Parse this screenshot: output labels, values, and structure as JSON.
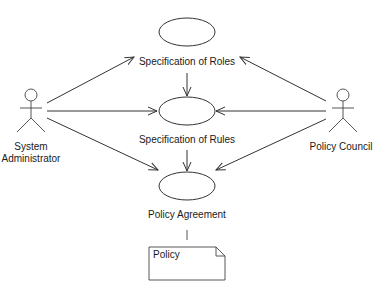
{
  "diagram": {
    "type": "UML use case diagram",
    "colors": {
      "line": "#333333",
      "text": "#1a1a1a",
      "background": "#ffffff"
    },
    "actors": [
      {
        "id": "sysadmin",
        "label_line1": "System",
        "label_line2": "Administrator",
        "icon": "stick-figure-icon"
      },
      {
        "id": "council",
        "label_line1": "Policy Council",
        "icon": "stick-figure-icon"
      }
    ],
    "use_cases": [
      {
        "id": "roles",
        "label": "Specification of Roles"
      },
      {
        "id": "rules",
        "label": "Specification of Rules"
      },
      {
        "id": "agreement",
        "label": "Policy Agreement"
      }
    ],
    "note": {
      "label": "Policy",
      "icon": "note-icon"
    },
    "associations": [
      {
        "from": "sysadmin",
        "to": "roles"
      },
      {
        "from": "sysadmin",
        "to": "rules"
      },
      {
        "from": "sysadmin",
        "to": "agreement"
      },
      {
        "from": "council",
        "to": "roles"
      },
      {
        "from": "council",
        "to": "rules"
      },
      {
        "from": "council",
        "to": "agreement"
      },
      {
        "from": "roles",
        "to": "rules"
      },
      {
        "from": "rules",
        "to": "agreement"
      },
      {
        "from": "agreement",
        "to": "note",
        "style": "plain"
      }
    ]
  }
}
